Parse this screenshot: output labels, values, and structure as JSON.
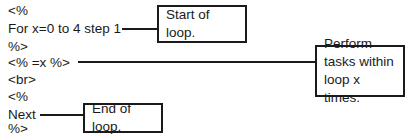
{
  "code": {
    "lines": [
      "<%",
      "For x=0 to 4 step 1",
      "%>",
      "<% =x %>",
      "<br>",
      "<%",
      "Next",
      "%>"
    ]
  },
  "callouts": {
    "start": "Start of loop.",
    "perform": "Perform tasks within loop x times.",
    "end": "End of loop."
  },
  "colors": {
    "ink": "#1a1a1a",
    "background": "#ffffff"
  }
}
